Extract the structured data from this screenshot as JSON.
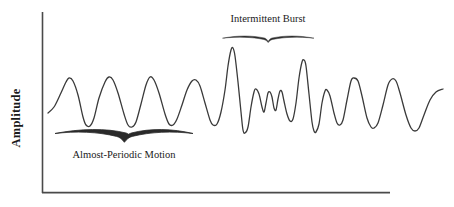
{
  "figure": {
    "background_color": "#ffffff",
    "line_color": "#3a3a3a",
    "axis_color": "#4a4a4a",
    "text_color": "#1a1a1a"
  },
  "axes": {
    "y_axis_title": "Amplitude",
    "x_axis_title": "",
    "y_tick_labels": [],
    "x_tick_labels": [],
    "grid": "off"
  },
  "annotations": [
    {
      "id": "intermittent-burst",
      "label": "Intermittent Burst",
      "brace_side": "below-label",
      "brace_weight": "thin"
    },
    {
      "id": "almost-periodic-motion",
      "label": "Almost-Periodic Motion",
      "brace_side": "above-label",
      "brace_weight": "thick"
    }
  ],
  "chart_data": {
    "type": "line",
    "title": "",
    "xlabel": "",
    "ylabel": "Amplitude",
    "xlim": [
      0,
      454
    ],
    "ylim": [
      207,
      0
    ],
    "grid": false,
    "legend": "none",
    "series": [
      {
        "name": "signal",
        "color": "#3a3a3a",
        "linewidth": 1.3,
        "points": [
          [
            48,
            113
          ],
          [
            54,
            107
          ],
          [
            60,
            95
          ],
          [
            66,
            82
          ],
          [
            69,
            78
          ],
          [
            73,
            81
          ],
          [
            78,
            95
          ],
          [
            83,
            117
          ],
          [
            86,
            125
          ],
          [
            90,
            126
          ],
          [
            94,
            118
          ],
          [
            99,
            98
          ],
          [
            105,
            82
          ],
          [
            109,
            77
          ],
          [
            113,
            80
          ],
          [
            118,
            93
          ],
          [
            124,
            114
          ],
          [
            128,
            125
          ],
          [
            132,
            127
          ],
          [
            136,
            122
          ],
          [
            141,
            104
          ],
          [
            146,
            85
          ],
          [
            150,
            77
          ],
          [
            154,
            80
          ],
          [
            159,
            93
          ],
          [
            165,
            114
          ],
          [
            169,
            124
          ],
          [
            173,
            125
          ],
          [
            177,
            119
          ],
          [
            182,
            105
          ],
          [
            187,
            90
          ],
          [
            192,
            81
          ],
          [
            196,
            80
          ],
          [
            200,
            86
          ],
          [
            205,
            103
          ],
          [
            210,
            120
          ],
          [
            213,
            125
          ],
          [
            217,
            124
          ],
          [
            221,
            112
          ],
          [
            225,
            90
          ],
          [
            228,
            66
          ],
          [
            231,
            50
          ],
          [
            233,
            48
          ],
          [
            235,
            56
          ],
          [
            238,
            82
          ],
          [
            241,
            112
          ],
          [
            243,
            130
          ],
          [
            245,
            133
          ],
          [
            248,
            127
          ],
          [
            251,
            107
          ],
          [
            254,
            92
          ],
          [
            256,
            89
          ],
          [
            259,
            94
          ],
          [
            262,
            107
          ],
          [
            264,
            112
          ],
          [
            266,
            103
          ],
          [
            268,
            93
          ],
          [
            270,
            92
          ],
          [
            272,
            97
          ],
          [
            274,
            108
          ],
          [
            276,
            110
          ],
          [
            278,
            99
          ],
          [
            280,
            91
          ],
          [
            282,
            92
          ],
          [
            284,
            101
          ],
          [
            287,
            114
          ],
          [
            290,
            121
          ],
          [
            293,
            119
          ],
          [
            296,
            103
          ],
          [
            299,
            78
          ],
          [
            302,
            62
          ],
          [
            304,
            60
          ],
          [
            306,
            66
          ],
          [
            309,
            94
          ],
          [
            312,
            122
          ],
          [
            314,
            131
          ],
          [
            316,
            132
          ],
          [
            319,
            124
          ],
          [
            322,
            103
          ],
          [
            325,
            91
          ],
          [
            327,
            90
          ],
          [
            330,
            96
          ],
          [
            334,
            113
          ],
          [
            337,
            123
          ],
          [
            340,
            125
          ],
          [
            343,
            120
          ],
          [
            347,
            100
          ],
          [
            351,
            81
          ],
          [
            354,
            78
          ],
          [
            358,
            81
          ],
          [
            362,
            96
          ],
          [
            367,
            118
          ],
          [
            371,
            127
          ],
          [
            374,
            128
          ],
          [
            378,
            123
          ],
          [
            383,
            105
          ],
          [
            388,
            85
          ],
          [
            392,
            79
          ],
          [
            396,
            81
          ],
          [
            400,
            93
          ],
          [
            406,
            115
          ],
          [
            411,
            128
          ],
          [
            415,
            131
          ],
          [
            419,
            128
          ],
          [
            424,
            115
          ],
          [
            430,
            100
          ],
          [
            436,
            92
          ],
          [
            443,
            89
          ]
        ]
      }
    ],
    "regions": [
      {
        "name": "almost-periodic",
        "x_start": 55,
        "x_end": 193
      },
      {
        "name": "intermittent-burst",
        "x_start": 222,
        "x_end": 313
      }
    ]
  }
}
